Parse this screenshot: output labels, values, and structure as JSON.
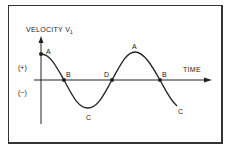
{
  "diagram": {
    "y_axis_label": "VELOCITY V",
    "y_axis_subscript": "1",
    "x_axis_label": "TIME",
    "positive_label": "(+)",
    "negative_label": "(−)",
    "points": [
      {
        "label": "A",
        "x": 41,
        "y": 54
      },
      {
        "label": "B",
        "x": 64,
        "y": 80
      },
      {
        "label": "C",
        "x": 88,
        "y": 108
      },
      {
        "label": "D",
        "x": 112,
        "y": 80
      },
      {
        "label": "A",
        "x": 135,
        "y": 52
      },
      {
        "label": "B",
        "x": 160,
        "y": 80
      },
      {
        "label": "C",
        "x": 177,
        "y": 106
      }
    ],
    "colors": {
      "line": "#222222",
      "background": "#ffffff"
    }
  }
}
